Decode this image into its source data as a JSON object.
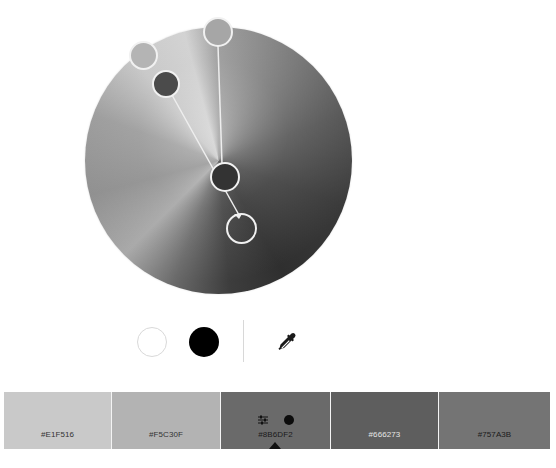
{
  "color_wheel": {
    "handles": [
      {
        "id": "handle-1",
        "color": "#b4b4b4",
        "style": "filled"
      },
      {
        "id": "handle-2",
        "color": "#a4a4a4",
        "style": "filled"
      },
      {
        "id": "handle-3",
        "color": "#4b4b4b",
        "style": "filled",
        "base": true
      },
      {
        "id": "handle-4",
        "color": "#333333",
        "style": "filled"
      },
      {
        "id": "handle-5",
        "color": "transparent",
        "style": "ring"
      }
    ]
  },
  "controls": {
    "white_circle_color": "#ffffff",
    "black_circle_color": "#000000",
    "eyedropper_icon": "eyedropper-icon"
  },
  "swatches": [
    {
      "hex": "#E1F516",
      "label": "#E1F516",
      "display_color": "#c9c9c9",
      "text_color": "#333333"
    },
    {
      "hex": "#F5C30F",
      "label": "#F5C30F",
      "display_color": "#b3b3b3",
      "text_color": "#333333"
    },
    {
      "hex": "#8B6DF2",
      "label": "#8B6DF2",
      "display_color": "#6a6a6a",
      "text_color": "#1a1a1a",
      "selected": true,
      "icons": [
        "adjust-sliders-icon",
        "base-color-dot-icon",
        "selected-caret-icon"
      ]
    },
    {
      "hex": "#666273",
      "label": "#666273",
      "display_color": "#5e5e5e",
      "text_color": "#e6e6e6"
    },
    {
      "hex": "#757A3B",
      "label": "#757A3B",
      "display_color": "#747474",
      "text_color": "#1a1a1a"
    }
  ]
}
